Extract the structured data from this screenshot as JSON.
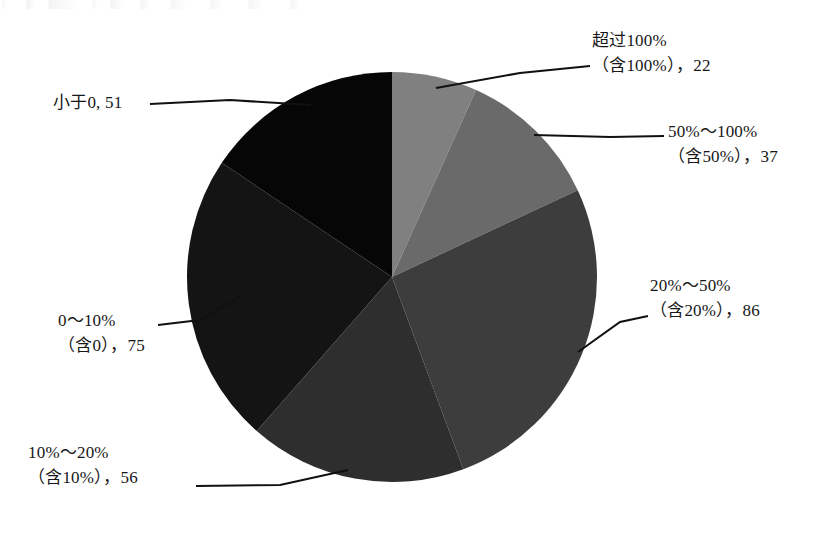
{
  "chart_data": {
    "type": "pie",
    "title": "",
    "subtitle": "",
    "xlabel": "",
    "ylabel": "",
    "legend_position": "none",
    "grid": false,
    "total": 327,
    "start_angle_deg": 0,
    "direction": "clockwise",
    "categories": [
      "超过100%（含100%）",
      "50%～100%（含50%）",
      "20%～50%（含20%）",
      "10%～20%（含10%）",
      "0～10%（含0）",
      "小于0"
    ],
    "values": [
      22,
      37,
      86,
      56,
      75,
      51
    ],
    "colors": [
      "#808080",
      "#6a6a6a",
      "#3d3d3d",
      "#2e2e2e",
      "#141414",
      "#060606"
    ],
    "slices": [
      {
        "label_line1": "超过100%",
        "label_line2": "（含100%），22",
        "value": 22,
        "color": "#808080",
        "start_deg": 0.0,
        "end_deg": 24.2
      },
      {
        "label_line1": "50%～100%",
        "label_line2": "（含50%），37",
        "value": 37,
        "color": "#6a6a6a",
        "start_deg": 24.2,
        "end_deg": 64.9
      },
      {
        "label_line1": "20%～50%",
        "label_line2": "（含20%），86",
        "value": 86,
        "color": "#3d3d3d",
        "start_deg": 64.9,
        "end_deg": 159.6
      },
      {
        "label_line1": "10%～20%",
        "label_line2": "（含10%），56",
        "value": 56,
        "color": "#2e2e2e",
        "start_deg": 159.6,
        "end_deg": 221.3
      },
      {
        "label_line1": "0～10%",
        "label_line2": "（含0），75",
        "value": 75,
        "color": "#141414",
        "start_deg": 221.3,
        "end_deg": 303.9
      },
      {
        "label_line1": "小于0, 51",
        "label_line2": "",
        "value": 51,
        "color": "#060606",
        "start_deg": 303.9,
        "end_deg": 360.0
      }
    ]
  },
  "labels": {
    "over100": {
      "line1": "超过100%",
      "line2": "（含100%），22"
    },
    "r50_100": {
      "line1": "50%～100%",
      "line2": "（含50%），37"
    },
    "r20_50": {
      "line1": "20%～50%",
      "line2": "（含20%），86"
    },
    "r10_20": {
      "line1": "10%～20%",
      "line2": "（含10%），56"
    },
    "r0_10": {
      "line1": "0～10%",
      "line2": "（含0），75"
    },
    "lt0": {
      "line1": "小于0, 51",
      "line2": ""
    }
  }
}
